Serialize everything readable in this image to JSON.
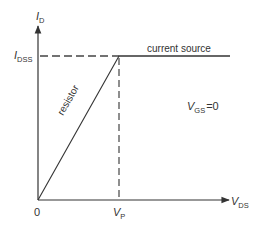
{
  "diagram": {
    "type": "jfet-output-characteristic",
    "y_axis": {
      "symbol": "I",
      "subscript": "D"
    },
    "x_axis": {
      "symbol": "V",
      "subscript": "DS"
    },
    "origin_label": "0",
    "level_label": {
      "symbol": "I",
      "subscript": "DSS"
    },
    "pinch_label": {
      "symbol": "V",
      "subscript": "P"
    },
    "region_labels": {
      "current_source": "current source",
      "resistor": "resistor"
    },
    "condition": {
      "symbol": "V",
      "subscript": "GS",
      "value": "=0"
    },
    "colors": {
      "line": "#333333",
      "dashed": "#444444",
      "background": "#ffffff"
    }
  }
}
